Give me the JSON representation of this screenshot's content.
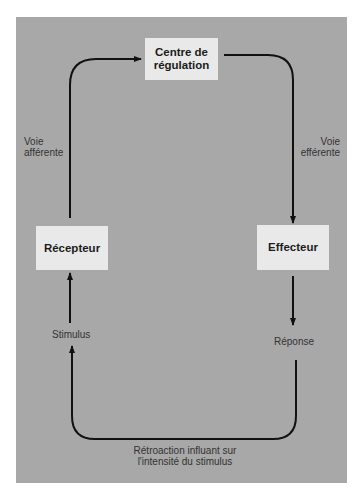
{
  "diagram": {
    "nodes": {
      "control_center": {
        "line1": "Centre de",
        "line2": "régulation"
      },
      "receptor": {
        "label": "Récepteur"
      },
      "effector": {
        "label": "Effecteur"
      }
    },
    "labels": {
      "afferent": {
        "line1": "Voie",
        "line2": "afférente"
      },
      "efferent": {
        "line1": "Voie",
        "line2": "efférente"
      },
      "stimulus": "Stimulus",
      "response": "Réponse",
      "feedback": {
        "line1": "Rétroaction influant sur",
        "line2": "l'intensité du stimulus"
      }
    },
    "edges": [
      {
        "from": "receptor",
        "to": "control_center",
        "label": "Voie afférente"
      },
      {
        "from": "control_center",
        "to": "effector",
        "label": "Voie efférente"
      },
      {
        "from": "effector",
        "to": "response"
      },
      {
        "from": "response",
        "to": "stimulus",
        "label": "Rétroaction influant sur l'intensité du stimulus"
      },
      {
        "from": "stimulus",
        "to": "receptor"
      }
    ],
    "colors": {
      "panel": "#a8a8a8",
      "box": "#e9e9e9",
      "line": "#111111"
    }
  }
}
